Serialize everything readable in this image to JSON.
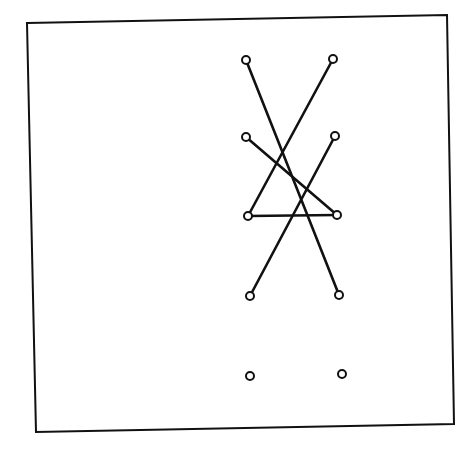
{
  "canvas": {
    "width": 467,
    "height": 461,
    "background": "#ffffff"
  },
  "style": {
    "stroke_color": "#111111",
    "frame_stroke_width": 2,
    "line_stroke_width": 2.6,
    "node_stroke_width": 2,
    "node_radius": 4,
    "node_fill": "#ffffff"
  },
  "frame": {
    "corners": [
      [
        27,
        23
      ],
      [
        447,
        15
      ],
      [
        454,
        424
      ],
      [
        36,
        432
      ]
    ]
  },
  "nodes": [
    {
      "id": "n1",
      "x": 246,
      "y": 60
    },
    {
      "id": "n2",
      "x": 333,
      "y": 59
    },
    {
      "id": "n3",
      "x": 246,
      "y": 137
    },
    {
      "id": "n4",
      "x": 335,
      "y": 136
    },
    {
      "id": "n5",
      "x": 248,
      "y": 216
    },
    {
      "id": "n6",
      "x": 337,
      "y": 215
    },
    {
      "id": "n7",
      "x": 250,
      "y": 296
    },
    {
      "id": "n8",
      "x": 339,
      "y": 295
    },
    {
      "id": "n9",
      "x": 250,
      "y": 376
    },
    {
      "id": "n10",
      "x": 342,
      "y": 374
    }
  ],
  "edges": [
    {
      "from": "n1",
      "to": "n8"
    },
    {
      "from": "n2",
      "to": "n5"
    },
    {
      "from": "n3",
      "to": "n6"
    },
    {
      "from": "n4",
      "to": "n7"
    },
    {
      "from": "n5",
      "to": "n6"
    }
  ]
}
